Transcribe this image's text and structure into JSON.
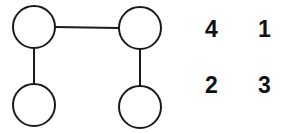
{
  "diagram": {
    "stroke_color": "#1a1a1a",
    "nodes": [
      {
        "id": "top-left",
        "cx": 34,
        "cy": 27,
        "r": 21
      },
      {
        "id": "top-right",
        "cx": 140,
        "cy": 28,
        "r": 21
      },
      {
        "id": "bottom-left",
        "cx": 34,
        "cy": 105,
        "r": 21
      },
      {
        "id": "bottom-right",
        "cx": 140,
        "cy": 107,
        "r": 21
      }
    ],
    "edges": [
      {
        "from": "top-left",
        "to": "top-right"
      },
      {
        "from": "top-left",
        "to": "bottom-left"
      },
      {
        "from": "top-right",
        "to": "bottom-right"
      }
    ]
  },
  "labels": {
    "top_left": "4",
    "top_right": "1",
    "bottom_left": "2",
    "bottom_right": "3"
  }
}
